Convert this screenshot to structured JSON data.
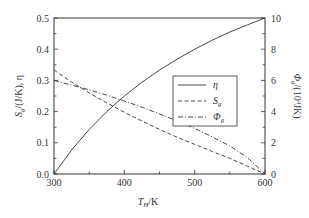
{
  "chart_data": {
    "type": "line",
    "title": "",
    "xlabel": "T_H/K",
    "ylabel_left": "S_g/(J/K), η",
    "ylabel_right": "Φ_g/(10^4 JK)",
    "xlim": [
      300,
      600
    ],
    "ylim_left": [
      0.0,
      0.5
    ],
    "ylim_right": [
      0,
      10
    ],
    "x_ticks": [
      "300",
      "400",
      "500",
      "600"
    ],
    "y_left_ticks": [
      "0.0",
      "0.1",
      "0.2",
      "0.3",
      "0.4",
      "0.5"
    ],
    "y_right_ticks": [
      "0",
      "2",
      "4",
      "6",
      "8",
      "10"
    ],
    "grid": false,
    "legend_position": "center-right inside",
    "x": [
      300,
      325,
      350,
      375,
      400,
      425,
      450,
      475,
      500,
      525,
      550,
      575,
      600
    ],
    "series": [
      {
        "name": "η",
        "axis": "left",
        "style": "solid",
        "values": [
          0.0,
          0.077,
          0.143,
          0.2,
          0.25,
          0.294,
          0.333,
          0.368,
          0.4,
          0.429,
          0.455,
          0.478,
          0.5
        ]
      },
      {
        "name": "S_g",
        "axis": "left",
        "style": "dashed",
        "values": [
          0.333,
          0.295,
          0.26,
          0.228,
          0.198,
          0.17,
          0.143,
          0.118,
          0.095,
          0.072,
          0.05,
          0.025,
          0.0
        ]
      },
      {
        "name": "Φ_g",
        "axis": "right",
        "style": "dash-dot",
        "values": [
          6.0,
          5.7,
          5.4,
          5.05,
          4.68,
          4.28,
          3.85,
          3.4,
          2.92,
          2.38,
          1.8,
          1.05,
          0.0
        ]
      }
    ]
  },
  "labels": {
    "x_axis_main": "T",
    "x_axis_sub": "H",
    "x_axis_unit": "/K",
    "y_left_main": "S",
    "y_left_sub": "g",
    "y_left_rest": "/(J/K), η",
    "y_right_main": "Φ",
    "y_right_sub": "g",
    "y_right_rest": "/(10",
    "y_right_sup": "4",
    "y_right_end": "JK)"
  },
  "legend": [
    {
      "label": "η",
      "sub": "",
      "style": "solid"
    },
    {
      "label": "S",
      "sub": "g",
      "style": "dashed"
    },
    {
      "label": "Φ",
      "sub": "g",
      "style": "dash-dot"
    }
  ]
}
